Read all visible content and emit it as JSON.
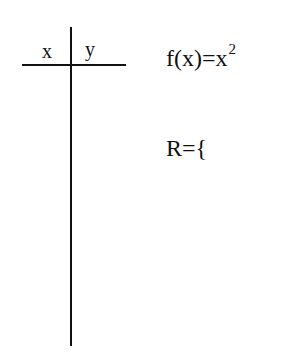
{
  "table": {
    "col_x": "x",
    "col_y": "y",
    "rows": []
  },
  "function": {
    "lhs": "f(x)",
    "equals": "=",
    "base": "x",
    "exponent": "2"
  },
  "relation": {
    "label": "R",
    "equals": "=",
    "open_brace": "{"
  }
}
